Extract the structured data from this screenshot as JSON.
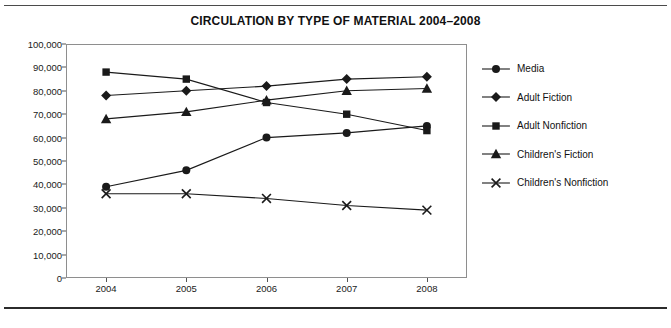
{
  "chart_data": {
    "type": "line",
    "title": "CIRCULATION BY TYPE OF MATERIAL 2004–2008",
    "xlabel": "",
    "ylabel": "",
    "categories": [
      "2004",
      "2005",
      "2006",
      "2007",
      "2008"
    ],
    "ylim": [
      0,
      100000
    ],
    "ytick_step": 10000,
    "ytick_labels": [
      "100,000",
      "90,000",
      "80,000",
      "70,000",
      "60,000",
      "50,000",
      "40,000",
      "30,000",
      "20,000",
      "10,000",
      "0"
    ],
    "ytick_values": [
      100000,
      90000,
      80000,
      70000,
      60000,
      50000,
      40000,
      30000,
      20000,
      10000,
      0
    ],
    "grid": false,
    "legend_position": "right",
    "series": [
      {
        "name": "Media",
        "marker": "circle",
        "values": [
          39000,
          46000,
          60000,
          62000,
          65000
        ]
      },
      {
        "name": "Adult Fiction",
        "marker": "diamond",
        "values": [
          78000,
          80000,
          82000,
          85000,
          86000
        ]
      },
      {
        "name": "Adult Nonfiction",
        "marker": "square",
        "values": [
          88000,
          85000,
          75000,
          70000,
          63000
        ]
      },
      {
        "name": "Children's Fiction",
        "marker": "triangle",
        "values": [
          68000,
          71000,
          76000,
          80000,
          81000
        ]
      },
      {
        "name": "Children's Nonfiction",
        "marker": "cross",
        "values": [
          36000,
          36000,
          34000,
          31000,
          29000
        ]
      }
    ],
    "colors": {
      "series_line": "#1a1a1a",
      "axis": "#8e8e8e",
      "text": "#1a1a1a",
      "background": "#ffffff"
    }
  }
}
